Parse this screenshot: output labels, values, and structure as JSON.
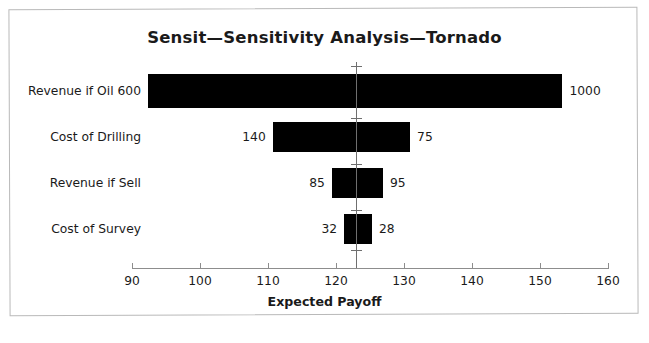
{
  "chart_data": {
    "type": "bar",
    "subtype": "tornado",
    "title": "Sensit—Sensitivity Analysis—Tornado",
    "xlabel": "Expected Payoff",
    "ylabel": "",
    "xlim": [
      90,
      160
    ],
    "xticks": [
      90,
      100,
      110,
      120,
      130,
      140,
      150,
      160
    ],
    "xtick_labels": [
      "90",
      "100",
      "110",
      "120",
      "130",
      "140",
      "150",
      "160"
    ],
    "grid": false,
    "legend": null,
    "base_value": 122.9,
    "bar_color": "#000000",
    "axis_color": "#8d8d8d",
    "spine_color": "#6f6f6f",
    "categories": [
      "Revenue if Oil 600",
      "Cost of Drilling",
      "Revenue if Sell",
      "Cost of Survey"
    ],
    "bars": [
      {
        "category": "Revenue if Oil 600",
        "low_label": "600",
        "high_label": "1000",
        "low_label_inline": true,
        "x_start": 92.4,
        "x_end": 153.3
      },
      {
        "category": "Cost of Drilling",
        "low_label": "140",
        "high_label": "75",
        "low_label_inline": false,
        "x_start": 110.7,
        "x_end": 130.9
      },
      {
        "category": "Revenue if Sell",
        "low_label": "85",
        "high_label": "95",
        "low_label_inline": false,
        "x_start": 119.4,
        "x_end": 126.9
      },
      {
        "category": "Cost of Survey",
        "low_label": "32",
        "high_label": "28",
        "low_label_inline": false,
        "x_start": 121.2,
        "x_end": 125.3
      }
    ]
  }
}
